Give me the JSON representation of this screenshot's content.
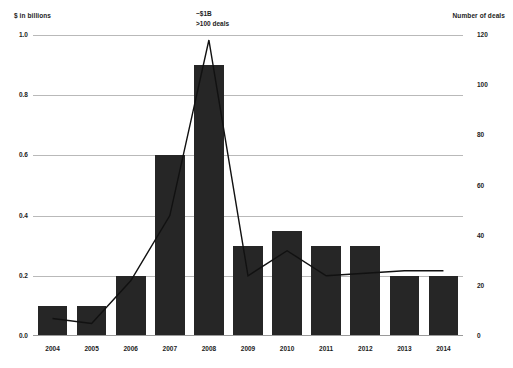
{
  "chart_data": {
    "type": "bar",
    "title": "",
    "subtitle": "",
    "categories": [
      "2004",
      "2005",
      "2006",
      "2007",
      "2008",
      "2009",
      "2010",
      "2011",
      "2012",
      "2013",
      "2014"
    ],
    "xlabel": "",
    "grid": true,
    "legend": "none",
    "series": [
      {
        "name": "Deal value",
        "type": "bar",
        "axis": "left",
        "unit": "$ in billions",
        "values": [
          0.1,
          0.1,
          0.2,
          0.6,
          0.9,
          0.3,
          0.35,
          0.3,
          0.3,
          0.2,
          0.2
        ],
        "color": "#262626"
      },
      {
        "name": "Number of deals",
        "type": "line",
        "axis": "right",
        "unit": "deals",
        "values": [
          7,
          5,
          22,
          48,
          118,
          24,
          34,
          24,
          25,
          26,
          26
        ],
        "color": "#111111"
      }
    ],
    "left_axis": {
      "label": "$ in billions",
      "ticks": [
        "0.0",
        "0.2",
        "0.4",
        "0.6",
        "0.8",
        "1.0"
      ],
      "values": [
        0.0,
        0.2,
        0.4,
        0.6,
        0.8,
        1.0
      ],
      "ylim": [
        0.0,
        1.0
      ]
    },
    "right_axis": {
      "label": "Number of deals",
      "ticks": [
        "0",
        "20",
        "40",
        "60",
        "80",
        "100",
        "120"
      ],
      "values": [
        0,
        20,
        40,
        60,
        80,
        100,
        120
      ],
      "ylim": [
        0,
        120
      ]
    },
    "annotations": [
      {
        "name": "peak-callout",
        "line1": "~$1B",
        "line2": ">100 deals",
        "at_category": "2008"
      }
    ]
  },
  "colors": {
    "bar": "#262626",
    "line": "#111111",
    "grid": "#b9b9b9",
    "text": "#1c1c1c",
    "background": "#ffffff"
  }
}
